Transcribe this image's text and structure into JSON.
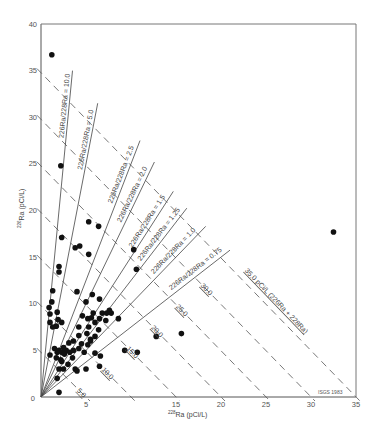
{
  "chart_data": {
    "type": "scatter",
    "title": "",
    "xlabel": "228Ra (pCi/L)",
    "ylabel": "226Ra (pCi/L)",
    "xlim": [
      0,
      35
    ],
    "ylim": [
      0,
      40
    ],
    "x_ticks": [
      0,
      5,
      15,
      20,
      25,
      30,
      35
    ],
    "y_ticks": [
      5,
      10,
      15,
      20,
      25,
      30,
      35,
      40
    ],
    "grid": false,
    "credit": "ISGS 1983",
    "ratio_lines": [
      {
        "ratio": 10.0,
        "label": "226Ra/228Ra = 10.0",
        "x_end": 3.5
      },
      {
        "ratio": 5.0,
        "label": "226Ra/228Ra = 5.0",
        "x_end": 6.3
      },
      {
        "ratio": 2.5,
        "label": "226Ra/228Ra = 2.5",
        "x_end": 11.0
      },
      {
        "ratio": 2.0,
        "label": "226Ra/228Ra = 2.0",
        "x_end": 12.6
      },
      {
        "ratio": 1.5,
        "label": "226Ra/228Ra = 1.5",
        "x_end": 14.7
      },
      {
        "ratio": 1.25,
        "label": "226Ra/228Ra = 1.25",
        "x_end": 16.2
      },
      {
        "ratio": 1.0,
        "label": "226Ra/228Ra = 1.0",
        "x_end": 18.3
      },
      {
        "ratio": 0.75,
        "label": "226Ra/228Ra = 0.75",
        "x_end": 21.0
      }
    ],
    "iso_sum_lines": [
      {
        "sum": 5,
        "label": "5.0"
      },
      {
        "sum": 10,
        "label": "10.0"
      },
      {
        "sum": 15,
        "label": "15.0"
      },
      {
        "sum": 20,
        "label": "20.0"
      },
      {
        "sum": 25,
        "label": "25.0"
      },
      {
        "sum": 30,
        "label": "30.0"
      },
      {
        "sum": 35,
        "label": "35.0 pCi/L (226Ra + 228Ra)"
      }
    ],
    "points": [
      [
        1.2,
        36.7
      ],
      [
        32.5,
        17.7
      ],
      [
        2.2,
        24.8
      ],
      [
        5.3,
        18.8
      ],
      [
        6.4,
        18.3
      ],
      [
        3.8,
        16.0
      ],
      [
        4.3,
        16.2
      ],
      [
        5.3,
        15.3
      ],
      [
        10.3,
        15.8
      ],
      [
        2.3,
        17.1
      ],
      [
        2.0,
        13.4
      ],
      [
        10.6,
        13.7
      ],
      [
        2.0,
        14.0
      ],
      [
        1.3,
        11.4
      ],
      [
        1.2,
        10.2
      ],
      [
        5.0,
        10.2
      ],
      [
        5.7,
        11.0
      ],
      [
        6.5,
        10.5
      ],
      [
        4.0,
        11.3
      ],
      [
        6.8,
        9.0
      ],
      [
        7.3,
        9.0
      ],
      [
        0.9,
        9.6
      ],
      [
        1.0,
        8.9
      ],
      [
        1.8,
        9.1
      ],
      [
        1.0,
        8.0
      ],
      [
        1.9,
        8.3
      ],
      [
        1.7,
        7.6
      ],
      [
        1.3,
        7.5
      ],
      [
        2.3,
        8.0
      ],
      [
        4.2,
        7.5
      ],
      [
        4.6,
        8.7
      ],
      [
        5.2,
        8.4
      ],
      [
        5.6,
        8.5
      ],
      [
        6.0,
        8.0
      ],
      [
        6.5,
        8.4
      ],
      [
        5.3,
        7.5
      ],
      [
        5.8,
        9.0
      ],
      [
        7.2,
        8.2
      ],
      [
        7.6,
        9.3
      ],
      [
        8.6,
        8.4
      ],
      [
        4.2,
        6.6
      ],
      [
        3.6,
        6.0
      ],
      [
        5.1,
        6.8
      ],
      [
        5.5,
        6.2
      ],
      [
        6.4,
        7.2
      ],
      [
        6.0,
        6.5
      ],
      [
        3.1,
        5.8
      ],
      [
        1.5,
        5.2
      ],
      [
        2.0,
        5.0
      ],
      [
        2.3,
        4.8
      ],
      [
        2.8,
        5.0
      ],
      [
        3.2,
        4.8
      ],
      [
        2.6,
        4.6
      ],
      [
        3.6,
        5.0
      ],
      [
        4.2,
        5.2
      ],
      [
        4.5,
        5.7
      ],
      [
        4.8,
        4.8
      ],
      [
        5.2,
        5.6
      ],
      [
        6.0,
        4.7
      ],
      [
        6.6,
        4.4
      ],
      [
        5.5,
        6.0
      ],
      [
        1.7,
        4.2
      ],
      [
        2.2,
        4.0
      ],
      [
        3.5,
        4.2
      ],
      [
        3.0,
        3.5
      ],
      [
        2.5,
        3.0
      ],
      [
        2.0,
        3.0
      ],
      [
        3.8,
        3.0
      ],
      [
        4.0,
        2.8
      ],
      [
        1.0,
        4.5
      ],
      [
        2.3,
        3.8
      ],
      [
        1.8,
        2.0
      ],
      [
        7.8,
        9.0
      ],
      [
        9.3,
        5.0
      ],
      [
        10.7,
        4.8
      ],
      [
        15.6,
        6.8
      ],
      [
        12.8,
        6.5
      ],
      [
        5.0,
        3.0
      ],
      [
        6.5,
        3.3
      ],
      [
        2.0,
        0.5
      ],
      [
        1.8,
        4.8
      ],
      [
        2.5,
        5.3
      ]
    ]
  },
  "axes": {
    "x_title_sup": "228",
    "x_title_main": "Ra (pCi/L)",
    "y_title_sup": "226",
    "y_title_main": "Ra (pCi/L)"
  }
}
